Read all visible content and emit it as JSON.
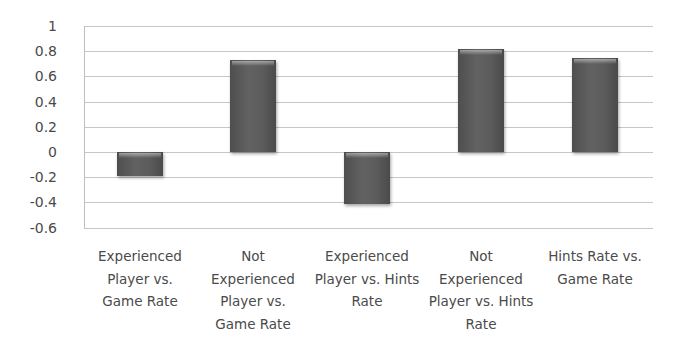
{
  "chart_data": {
    "type": "bar",
    "title": "",
    "xlabel": "",
    "ylabel": "",
    "ylim": [
      -0.6,
      1
    ],
    "yticks": [
      1,
      0.8,
      0.6,
      0.4,
      0.2,
      0,
      -0.2,
      -0.4,
      -0.6
    ],
    "ytick_labels": [
      "1",
      "0.8",
      "0.6",
      "0.4",
      "0.2",
      "0",
      "-0.2",
      "-0.4",
      "-0.6"
    ],
    "grid": true,
    "legend": null,
    "categories": [
      "Experienced Player vs. Game Rate",
      "Not Experienced Player vs. Game Rate",
      "Experienced Player vs. Hints Rate",
      "Not Experienced Player vs. Hints Rate",
      "Hints Rate vs. Game Rate"
    ],
    "category_label_lines": [
      [
        "Experienced",
        "Player vs.",
        "Game Rate"
      ],
      [
        "Not",
        "Experienced",
        "Player vs.",
        "Game Rate"
      ],
      [
        "Experienced",
        "Player vs. Hints",
        "Rate"
      ],
      [
        "Not",
        "Experienced",
        "Player vs. Hints",
        "Rate"
      ],
      [
        "Hints Rate vs.",
        "Game Rate"
      ]
    ],
    "values": [
      -0.19,
      0.73,
      -0.41,
      0.82,
      0.75
    ],
    "colors": {
      "bar": "#595959",
      "grid": "#c6c6c6",
      "text": "#4a4a4a"
    }
  }
}
